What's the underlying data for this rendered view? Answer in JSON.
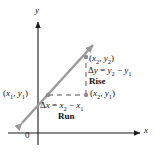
{
  "figure": {
    "axes": {
      "x_label": "x",
      "y_label": "y",
      "origin_label": "0",
      "axis_color": "#1a1a1a"
    },
    "line": {
      "color": "#9a9a9a",
      "style": "double-headed-arrow"
    },
    "dashed": {
      "color": "#8c8c8c"
    },
    "labels": {
      "point1": {
        "open": "(",
        "x": "x",
        "xsub": "1",
        "comma": ", ",
        "y": "y",
        "ysub": "1",
        "close": ")"
      },
      "point2": {
        "open": "(",
        "x": "x",
        "xsub": "2",
        "comma": ", ",
        "y": "y",
        "ysub": "2",
        "close": ")"
      },
      "point3": {
        "open": "(",
        "x": "x",
        "xsub": "2",
        "comma": ", ",
        "y": "y",
        "ysub": "1",
        "close": ")"
      },
      "delta_y": {
        "delta": "Δ",
        "v": "y",
        "eq": " = ",
        "t1": "y",
        "t1sub": "2",
        "minus": " − ",
        "t2": "y",
        "t2sub": "1"
      },
      "delta_x": {
        "delta": "Δ",
        "v": "x",
        "eq": " = ",
        "t1": "x",
        "t1sub": "2",
        "minus": " − ",
        "t2": "x",
        "t2sub": "1"
      },
      "rise": "Rise",
      "run": "Run"
    }
  }
}
